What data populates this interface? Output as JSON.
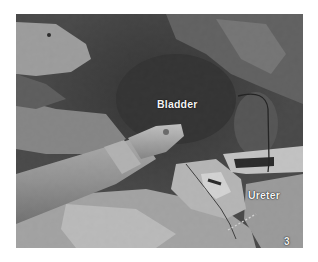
{
  "figure": {
    "type": "grayscale laparoscopic surgical photograph",
    "labels": {
      "bladder": "Bladder",
      "ureter": "Ureter",
      "figure_number": "3"
    },
    "colors": {
      "background": "#ffffff",
      "label_text": "#f4f4f4"
    }
  }
}
